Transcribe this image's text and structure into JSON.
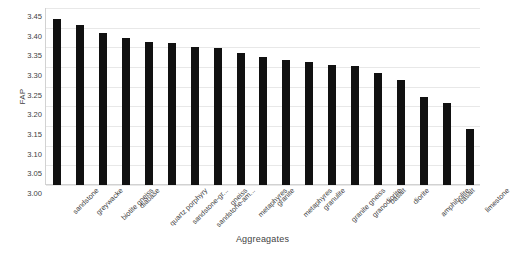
{
  "chart_data": {
    "type": "bar",
    "title": "",
    "xlabel": "Aggreagates",
    "ylabel": "FAP",
    "ylim": [
      3.0,
      3.45
    ],
    "ytick_step": 0.05,
    "grid": true,
    "legend": "none",
    "bar_color": "#111111",
    "gridline_color": "#e8e8e8",
    "axis_color": "#d2d2d2",
    "ytick_labels": [
      "3.45",
      "3.40",
      "3.35",
      "3.30",
      "3.25",
      "3.20",
      "3.15",
      "3.10",
      "3.05",
      "3.00"
    ],
    "ytick_values": [
      3.45,
      3.4,
      3.35,
      3.3,
      3.25,
      3.2,
      3.15,
      3.1,
      3.05,
      3.0
    ],
    "categories": [
      "sandstone",
      "greywacke",
      "biotite gneiss",
      "diabase",
      "quartz porphyry",
      "sandstone-gr...",
      "sandstone-am...",
      "gneiss",
      "metaphyres",
      "granite",
      "metaphyres",
      "granulite",
      "granite gneiss",
      "granodiorite",
      "basalt",
      "diorite",
      "amphibolite",
      "basalt",
      "limestone"
    ],
    "values": [
      3.422,
      3.407,
      3.386,
      3.374,
      3.364,
      3.36,
      3.35,
      3.348,
      3.335,
      3.326,
      3.317,
      3.312,
      3.306,
      3.303,
      3.285,
      3.267,
      3.224,
      3.208,
      3.142
    ]
  }
}
